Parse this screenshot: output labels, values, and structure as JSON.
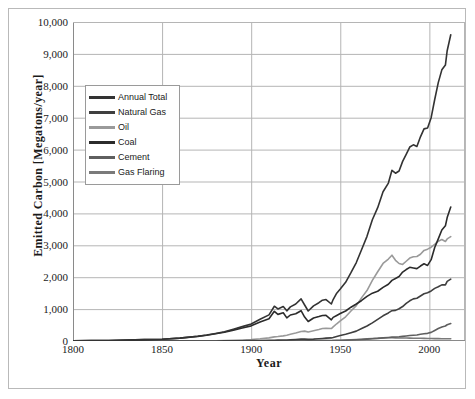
{
  "chart_data": {
    "type": "line",
    "title": "",
    "xlabel": "Year",
    "ylabel": "Emitted Carbon [Megatons/year]",
    "xlim": [
      1800,
      2020
    ],
    "ylim": [
      0,
      10000
    ],
    "xticks": [
      1800,
      1850,
      1900,
      1950,
      2000
    ],
    "xtick_labels": [
      "1800",
      "1850",
      "1900",
      "1950",
      "2000"
    ],
    "yticks": [
      0,
      1000,
      2000,
      3000,
      4000,
      5000,
      6000,
      7000,
      8000,
      9000,
      10000
    ],
    "ytick_labels": [
      "0",
      "1,000",
      "2,000",
      "3,000",
      "4,000",
      "5,000",
      "6,000",
      "7,000",
      "8,000",
      "9,000",
      "10,000"
    ],
    "grid": "horizontal-and-vertical",
    "legend_position": "upper-left-inside",
    "x": [
      1800,
      1810,
      1820,
      1830,
      1840,
      1850,
      1860,
      1870,
      1875,
      1880,
      1885,
      1890,
      1895,
      1900,
      1905,
      1910,
      1913,
      1915,
      1918,
      1920,
      1922,
      1925,
      1928,
      1930,
      1932,
      1935,
      1938,
      1940,
      1942,
      1945,
      1946,
      1948,
      1950,
      1953,
      1956,
      1959,
      1962,
      1965,
      1968,
      1971,
      1974,
      1977,
      1979,
      1981,
      1983,
      1985,
      1987,
      1989,
      1991,
      1993,
      1995,
      1997,
      1999,
      2001,
      2003,
      2005,
      2007,
      2009,
      2010,
      2012
    ],
    "series": [
      {
        "name": "Annual Total",
        "color": "#333333",
        "values": [
          8,
          12,
          18,
          27,
          42,
          54,
          91,
          147,
          187,
          236,
          290,
          369,
          450,
          534,
          683,
          819,
          1090,
          1005,
          1080,
          945,
          1070,
          1160,
          1320,
          1128,
          940,
          1100,
          1200,
          1280,
          1300,
          1160,
          1300,
          1500,
          1630,
          1840,
          2140,
          2460,
          2870,
          3280,
          3800,
          4180,
          4680,
          4950,
          5350,
          5260,
          5330,
          5630,
          5850,
          6080,
          6150,
          6100,
          6400,
          6650,
          6680,
          7000,
          7570,
          8100,
          8500,
          8650,
          9100,
          9600
        ]
      },
      {
        "name": "Natural Gas",
        "color": "#3f3f3f",
        "values": [
          0,
          0,
          0,
          0,
          0,
          0,
          0,
          0,
          1,
          2,
          3,
          5,
          8,
          11,
          16,
          21,
          25,
          26,
          30,
          33,
          40,
          48,
          58,
          60,
          52,
          60,
          72,
          80,
          90,
          97,
          110,
          140,
          170,
          210,
          260,
          310,
          390,
          470,
          570,
          680,
          790,
          880,
          950,
          960,
          1010,
          1080,
          1180,
          1260,
          1320,
          1340,
          1410,
          1480,
          1510,
          1570,
          1650,
          1700,
          1760,
          1760,
          1870,
          1940
        ]
      },
      {
        "name": "Oil",
        "color": "#9a9a9a",
        "values": [
          0,
          0,
          0,
          0,
          0,
          0,
          1,
          3,
          5,
          9,
          14,
          22,
          32,
          47,
          70,
          99,
          130,
          140,
          160,
          180,
          210,
          250,
          300,
          310,
          280,
          320,
          360,
          390,
          400,
          390,
          440,
          540,
          630,
          760,
          940,
          1110,
          1360,
          1580,
          1900,
          2170,
          2430,
          2570,
          2690,
          2530,
          2430,
          2400,
          2500,
          2600,
          2640,
          2650,
          2720,
          2840,
          2880,
          2940,
          3030,
          3130,
          3180,
          3120,
          3200,
          3270
        ]
      },
      {
        "name": "Coal",
        "color": "#2b2b2b",
        "values": [
          8,
          12,
          18,
          27,
          42,
          54,
          90,
          144,
          180,
          225,
          272,
          341,
          409,
          475,
          594,
          697,
          930,
          835,
          885,
          725,
          815,
          855,
          950,
          750,
          610,
          720,
          765,
          800,
          805,
          665,
          740,
          800,
          860,
          940,
          1060,
          1160,
          1270,
          1400,
          1500,
          1560,
          1680,
          1780,
          1900,
          1960,
          2020,
          2160,
          2240,
          2310,
          2290,
          2270,
          2350,
          2420,
          2370,
          2550,
          2930,
          3200,
          3480,
          3610,
          3870,
          4200
        ]
      },
      {
        "name": "Cement",
        "color": "#5f5f5f",
        "values": [
          0,
          0,
          0,
          0,
          0,
          0,
          0,
          0,
          0,
          0,
          1,
          1,
          2,
          3,
          4,
          5,
          6,
          5,
          5,
          5,
          7,
          9,
          11,
          10,
          7,
          9,
          11,
          12,
          11,
          9,
          11,
          14,
          18,
          24,
          30,
          38,
          48,
          58,
          70,
          82,
          98,
          110,
          120,
          125,
          132,
          145,
          158,
          172,
          180,
          190,
          210,
          225,
          240,
          270,
          330,
          390,
          440,
          470,
          510,
          550
        ]
      },
      {
        "name": "Gas Flaring",
        "color": "#7a7a7a",
        "values": [
          0,
          0,
          0,
          0,
          0,
          0,
          0,
          0,
          0,
          0,
          0,
          0,
          0,
          0,
          0,
          0,
          1,
          1,
          2,
          2,
          3,
          4,
          6,
          8,
          8,
          9,
          11,
          13,
          14,
          14,
          16,
          20,
          24,
          30,
          38,
          46,
          56,
          66,
          78,
          88,
          96,
          100,
          102,
          98,
          95,
          93,
          92,
          90,
          88,
          86,
          84,
          82,
          80,
          78,
          76,
          74,
          72,
          70,
          70,
          70
        ]
      }
    ]
  },
  "legend": {
    "items": [
      {
        "label": "Annual Total",
        "color": "#333333"
      },
      {
        "label": "Natural Gas",
        "color": "#3f3f3f"
      },
      {
        "label": "Oil",
        "color": "#9a9a9a"
      },
      {
        "label": "Coal",
        "color": "#2b2b2b"
      },
      {
        "label": "Cement",
        "color": "#5f5f5f"
      },
      {
        "label": "Gas Flaring",
        "color": "#7a7a7a"
      }
    ]
  },
  "style": {
    "grid_color": "#b5b5b5",
    "axis_color": "#8a8a8a",
    "frame_color": "#b9b9b9",
    "text_color": "#1a1a1a",
    "background": "#ffffff"
  }
}
